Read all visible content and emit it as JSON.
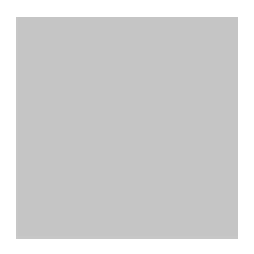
{
  "image": {
    "kind": "go-board-diagram",
    "width": 254,
    "height": 254,
    "background_color": "#ffffff"
  },
  "board": {
    "name": "go-board",
    "surface_color": "#c9c9c9",
    "line_color": "#2b2b2b",
    "left": 16,
    "top": 17,
    "width": 222,
    "height": 222,
    "cell_size": 24.2,
    "column_x": [
      28,
      52,
      76,
      100,
      124.5,
      148.7,
      172.9,
      197.1,
      221.3
    ],
    "row_y": [
      25.5,
      49.7,
      73.9,
      98.1,
      122.3,
      146.5,
      170.7,
      194.9,
      219.1
    ],
    "right_edge_x": 237,
    "bottom_edge_y": 238,
    "star_points": [
      {
        "name": "star-point-top-left-area",
        "x": 100,
        "y": 25.5
      },
      {
        "name": "star-point-top-right",
        "x": 237,
        "y": 25.5
      },
      {
        "name": "star-point-right",
        "x": 237,
        "y": 158
      }
    ]
  },
  "stones": [
    {
      "name": "black-stone",
      "color": "black",
      "x": 28,
      "y": 110,
      "marker": ""
    },
    {
      "name": "black-stone",
      "color": "black",
      "x": 52,
      "y": 110,
      "marker": ""
    },
    {
      "name": "black-stone",
      "color": "black",
      "x": 76,
      "y": 110,
      "marker": ""
    },
    {
      "name": "black-stone",
      "color": "black",
      "x": 76,
      "y": 134,
      "marker": ""
    },
    {
      "name": "black-stone",
      "color": "black",
      "x": 100,
      "y": 152,
      "marker": ""
    },
    {
      "name": "black-stone",
      "color": "black",
      "x": 100,
      "y": 176,
      "marker": ""
    },
    {
      "name": "black-stone",
      "color": "black",
      "x": 100,
      "y": 200,
      "marker": ""
    },
    {
      "name": "black-stone",
      "color": "black",
      "x": 100,
      "y": 224,
      "marker": ""
    },
    {
      "name": "black-stone-labeled-ga",
      "color": "black",
      "x": 28,
      "y": 196,
      "marker": "label",
      "label": "가"
    },
    {
      "name": "white-stone-triangle",
      "color": "white",
      "x": 28,
      "y": 159,
      "marker": "triangle"
    },
    {
      "name": "white-stone-triangle",
      "color": "white",
      "x": 52,
      "y": 159,
      "marker": "triangle"
    },
    {
      "name": "white-stone-triangle",
      "color": "white",
      "x": 52,
      "y": 183,
      "marker": "triangle"
    },
    {
      "name": "white-stone-triangle",
      "color": "white",
      "x": 76,
      "y": 183,
      "marker": "triangle"
    },
    {
      "name": "white-stone-triangle",
      "color": "white",
      "x": 76,
      "y": 207,
      "marker": "triangle"
    },
    {
      "name": "white-stone-triangle",
      "color": "white",
      "x": 52,
      "y": 228,
      "marker": "triangle"
    },
    {
      "name": "white-stone-triangle",
      "color": "white",
      "x": 76,
      "y": 228,
      "marker": "triangle"
    }
  ],
  "labels": {
    "ga_stone_text": "가",
    "triangle_glyph": "△"
  },
  "colors": {
    "black_stone": "#0d0d0d",
    "white_stone": "#f2f2f2",
    "board": "#c9c9c9",
    "lines": "#2b2b2b",
    "page": "#ffffff"
  }
}
